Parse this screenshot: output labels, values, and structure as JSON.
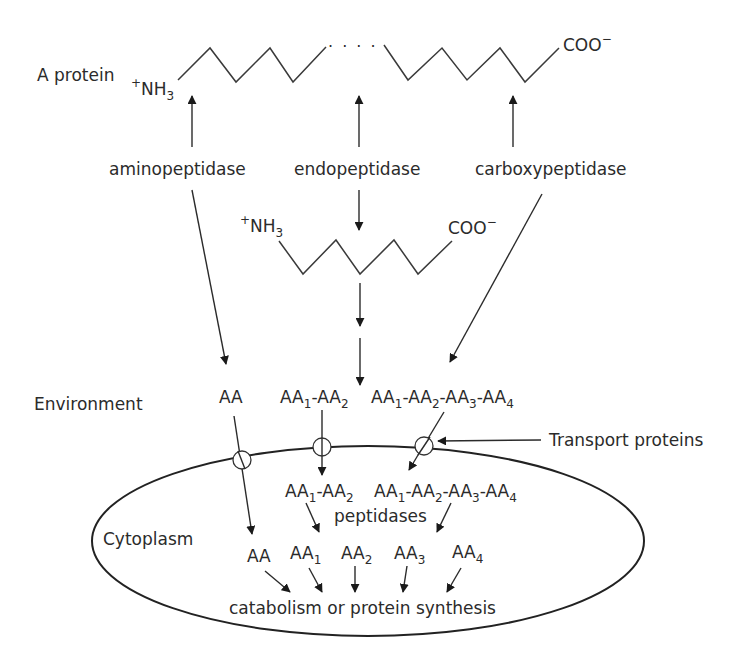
{
  "protein": {
    "label": "A protein",
    "n_terminus": {
      "charge": "+",
      "base": "NH",
      "sub": "3"
    },
    "c_terminus": {
      "base": "COO",
      "charge": "−"
    },
    "ellipsis": ". . . ."
  },
  "enzymes": {
    "amino": "aminopeptidase",
    "endo": "endopeptidase",
    "carboxy": "carboxypeptidase"
  },
  "fragment": {
    "n_terminus": {
      "charge": "+",
      "base": "NH",
      "sub": "3"
    },
    "c_terminus": {
      "base": "COO",
      "charge": "−"
    }
  },
  "environment": {
    "label": "Environment",
    "items": {
      "aa": "AA",
      "dipeptide": [
        {
          "b": "AA",
          "s": "1"
        },
        {
          "b": "-AA",
          "s": "2"
        }
      ],
      "tetrapeptide": [
        {
          "b": "AA",
          "s": "1"
        },
        {
          "b": "-AA",
          "s": "2"
        },
        {
          "b": "-AA",
          "s": "3"
        },
        {
          "b": "-AA",
          "s": "4"
        }
      ]
    }
  },
  "transport_label": "Transport proteins",
  "cytoplasm": {
    "label": "Cytoplasm",
    "dipeptide": [
      {
        "b": "AA",
        "s": "1"
      },
      {
        "b": "-AA",
        "s": "2"
      }
    ],
    "tetrapeptide": [
      {
        "b": "AA",
        "s": "1"
      },
      {
        "b": "-AA",
        "s": "2"
      },
      {
        "b": "-AA",
        "s": "3"
      },
      {
        "b": "-AA",
        "s": "4"
      }
    ],
    "peptidases": "peptidases",
    "amino_acids": [
      {
        "b": "AA",
        "s": ""
      },
      {
        "b": "AA",
        "s": "1"
      },
      {
        "b": "AA",
        "s": "2"
      },
      {
        "b": "AA",
        "s": "3"
      },
      {
        "b": "AA",
        "s": "4"
      }
    ],
    "fate": "catabolism or protein synthesis"
  }
}
